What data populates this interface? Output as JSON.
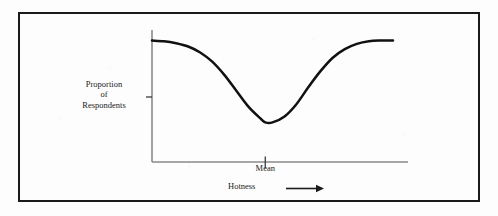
{
  "figure": {
    "frame": {
      "border_color": "#1a1a1a",
      "background_color": "#fdfdfd"
    },
    "axis_color": "#8a8a8a",
    "curve_color": "#111111"
  },
  "chart_data": {
    "type": "line",
    "title": "",
    "subtitle": "",
    "xlabel": "Hotness",
    "ylabel_lines": [
      "Proportion",
      "of",
      "Respondents"
    ],
    "ylabel": "Proportion of Respondents",
    "xlabel_arrow": "⟶",
    "annotations": [
      {
        "label": "Mean",
        "x_fraction": 0.47,
        "description": "tick mark on x-axis at the curve minimum"
      }
    ],
    "grid": false,
    "legend": null,
    "axis_ticks": {
      "x": [],
      "y": []
    },
    "xlim": [
      0,
      1
    ],
    "ylim": [
      0,
      1
    ],
    "series": [
      {
        "name": "Proportion of Respondents",
        "comment": "bimodal valley: high at both extremes, minimum at the mean",
        "x": [
          0.0,
          0.05,
          0.1,
          0.15,
          0.2,
          0.25,
          0.3,
          0.35,
          0.4,
          0.45,
          0.47,
          0.5,
          0.55,
          0.6,
          0.65,
          0.7,
          0.75,
          0.8,
          0.85,
          0.9,
          0.95,
          1.0
        ],
        "y": [
          0.92,
          0.915,
          0.9,
          0.875,
          0.83,
          0.76,
          0.66,
          0.54,
          0.42,
          0.33,
          0.3,
          0.3,
          0.345,
          0.44,
          0.57,
          0.69,
          0.79,
          0.855,
          0.895,
          0.915,
          0.92,
          0.92
        ]
      }
    ]
  },
  "labels": {
    "y_line1": "Proportion",
    "y_line2": "of",
    "y_line3": "Respondents",
    "mean": "Mean",
    "hotness": "Hotness"
  }
}
